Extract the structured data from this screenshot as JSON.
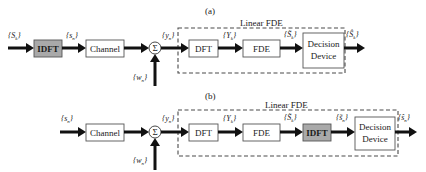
{
  "diagram_a": {
    "caption": "(a)",
    "group_label": "Linear FDE",
    "blocks": {
      "idft": "IDFT",
      "channel": "Channel",
      "sum": "Σ",
      "dft": "DFT",
      "fde": "FDE",
      "decision_line1": "Decision",
      "decision_line2": "Device"
    },
    "signals": {
      "input": "{S_k}",
      "input_main": "S",
      "input_sub": "k",
      "after_idft_main": "s",
      "after_idft_sub": "n",
      "noise_main": "w",
      "noise_sub": "n",
      "received_main": "y",
      "received_sub": "n",
      "freq_main": "Y",
      "freq_sub": "k",
      "equalized_main": "S̃",
      "equalized_sub": "k",
      "output_main": "Ŝ",
      "output_sub": "k"
    }
  },
  "diagram_b": {
    "caption": "(b)",
    "group_label": "Linear FDE",
    "blocks": {
      "channel": "Channel",
      "sum": "Σ",
      "dft": "DFT",
      "fde": "FDE",
      "idft": "IDFT",
      "decision_line1": "Decision",
      "decision_line2": "Device"
    },
    "signals": {
      "input_main": "s",
      "input_sub": "n",
      "noise_main": "w",
      "noise_sub": "n",
      "received_main": "y",
      "received_sub": "n",
      "freq_main": "Y",
      "freq_sub": "k",
      "equalized_main": "S̃",
      "equalized_sub": "k",
      "time_eq_main": "s̃",
      "time_eq_sub": "n",
      "output_main": "ŝ",
      "output_sub": "n"
    }
  },
  "colors": {
    "highlight_block": "#a9a9a9",
    "line": "#111111",
    "border": "#555555"
  }
}
